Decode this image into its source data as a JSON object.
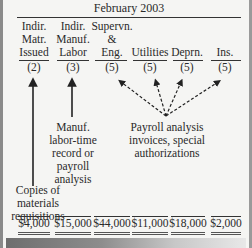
{
  "title": "February 2003",
  "columns": [
    {
      "header_lines": [
        "Indir.",
        "Matr.",
        "Issued"
      ],
      "ref": "(2)",
      "amount": "$4,000"
    },
    {
      "header_lines": [
        "Indir.",
        "Manuf.",
        "Labor"
      ],
      "ref": "(3)",
      "amount": "$15,000"
    },
    {
      "header_lines": [
        "Supervn.",
        "&",
        "Eng."
      ],
      "ref": "(5)",
      "amount": "$44,000"
    },
    {
      "header_lines": [
        "",
        "",
        "Utilities"
      ],
      "ref": "(5)",
      "amount": "$11,000"
    },
    {
      "header_lines": [
        "",
        "",
        "Deprn."
      ],
      "ref": "(5)",
      "amount": "$18,000"
    },
    {
      "header_lines": [
        "",
        "",
        "Ins."
      ],
      "ref": "(5)",
      "amount": "$2,000"
    }
  ],
  "sources": {
    "materials": [
      "Copies of",
      "materials",
      "requisitions"
    ],
    "labor": [
      "Manuf.",
      "labor-time",
      "record or",
      "payroll",
      "analysis"
    ],
    "other": [
      "Payroll analysis",
      "invoices, special",
      "authorizations"
    ]
  },
  "colors": {
    "text": "#2a2a2a",
    "background": "#f5f5f3",
    "border": "#8a8a8a"
  }
}
